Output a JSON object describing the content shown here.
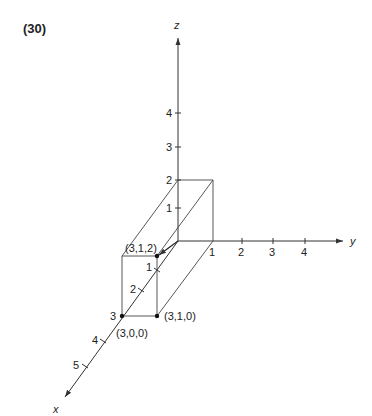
{
  "problem_number": "(30)",
  "axes": {
    "x": {
      "label": "x",
      "ticks": [
        "1",
        "2",
        "3",
        "4",
        "5"
      ]
    },
    "y": {
      "label": "y",
      "ticks": [
        "1",
        "2",
        "3",
        "4"
      ]
    },
    "z": {
      "label": "z",
      "ticks": [
        "1",
        "2",
        "3",
        "4"
      ]
    }
  },
  "points": {
    "p312": "(3,1,2)",
    "p310": "(3,1,0)",
    "p300": "(3,0,0)"
  },
  "colors": {
    "line": "#333333",
    "text": "#222222"
  }
}
